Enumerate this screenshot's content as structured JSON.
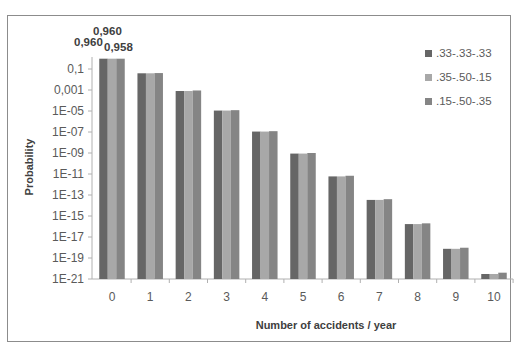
{
  "chart_data": {
    "type": "bar",
    "title": "",
    "xlabel": "Number of accidents / year",
    "ylabel": "Probability",
    "yscale": "log",
    "ylim": [
      1e-21,
      1
    ],
    "y_ticks": [
      "0,1",
      "0,001",
      "1E-05",
      "1E-07",
      "1E-09",
      "1E-11",
      "1E-13",
      "1E-15",
      "1E-17",
      "1E-19",
      "1E-21"
    ],
    "categories": [
      "0",
      "1",
      "2",
      "3",
      "4",
      "5",
      "6",
      "7",
      "8",
      "9",
      "10"
    ],
    "series": [
      {
        "name": ".33-.33-.33",
        "color": "#666666",
        "values": [
          0.96,
          0.039,
          0.0008,
          1.1e-05,
          1.1e-07,
          8.8e-10,
          5.9e-12,
          3.4e-14,
          1.7e-16,
          7.5e-19,
          3e-21
        ]
      },
      {
        "name": ".35-.50-.15",
        "color": "#a8a8a8",
        "values": [
          0.96,
          0.039,
          0.0008,
          1.1e-05,
          1.1e-07,
          8.8e-10,
          5.9e-12,
          3.4e-14,
          1.7e-16,
          7.5e-19,
          3e-21
        ]
      },
      {
        "name": ".15-.50-.35",
        "color": "#858585",
        "values": [
          0.958,
          0.041,
          0.0009,
          1.2e-05,
          1.2e-07,
          1e-09,
          6.8e-12,
          4e-14,
          2e-16,
          9.5e-19,
          4e-21
        ]
      }
    ],
    "data_labels": [
      {
        "category": "0",
        "series": ".33-.33-.33",
        "text": "0,960"
      },
      {
        "category": "0",
        "series": ".35-.50-.15",
        "text": "0,960"
      },
      {
        "category": "0",
        "series": ".15-.50-.35",
        "text": "0,958"
      }
    ],
    "legend_position": "right",
    "grid": false
  }
}
